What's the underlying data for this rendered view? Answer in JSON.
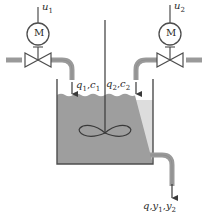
{
  "diagram": {
    "type": "process-flow-diagram",
    "background_color": "#ffffff",
    "line_color": "#4d4d4d",
    "pipe_color": "#9a9a9a",
    "liquid_color": "#9e9e9e",
    "valve_fill": "#ffffff",
    "text_color": "#2b2b2b"
  },
  "actuators": [
    {
      "id": "left",
      "signal_label": "u",
      "signal_sub": "1",
      "motor_label": "M",
      "motor_name": "motor-actuator"
    },
    {
      "id": "right",
      "signal_label": "u",
      "signal_sub": "2",
      "motor_label": "M",
      "motor_name": "motor-actuator"
    }
  ],
  "streams": {
    "inlet_left": {
      "flow": "q",
      "flow_sub": "1",
      "sep": ",",
      "conc": "c",
      "conc_sub": "1"
    },
    "inlet_right": {
      "flow": "q",
      "flow_sub": "2",
      "sep": ",",
      "conc": "c",
      "conc_sub": "2"
    },
    "outlet": {
      "flow": "q",
      "sep1": ",",
      "out1": "y",
      "out1_sub": "1",
      "sep2": ",",
      "out2": "y",
      "out2_sub": "2"
    }
  },
  "vessel": {
    "name": "mixing-tank",
    "stirrer_name": "impeller",
    "liquid_surface": "wavy"
  }
}
